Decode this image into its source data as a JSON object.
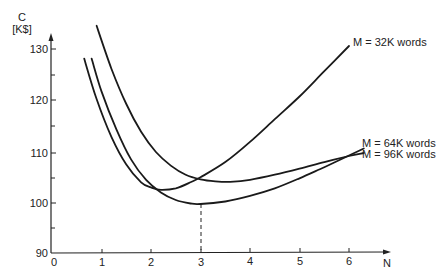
{
  "chart_data": {
    "type": "line",
    "title": "",
    "xlabel": "N",
    "ylabel": "C [K$]",
    "ylabel_lines": [
      "C",
      "[K$]"
    ],
    "xlim": [
      0,
      6.6
    ],
    "ylim": [
      90,
      133
    ],
    "x_ticks": [
      0,
      1,
      2,
      3,
      4,
      5,
      6
    ],
    "x_tick_labels": [
      "0",
      "1",
      "2",
      "3",
      "4",
      "5",
      "6"
    ],
    "y_ticks_major": [
      90,
      100,
      110,
      120,
      130
    ],
    "y_tick_labels": [
      "90",
      "100",
      "110",
      "120",
      "130"
    ],
    "y_ticks_minor": [
      95,
      105,
      115,
      125
    ],
    "grid": false,
    "legend": "inline labels at right end of curves",
    "series": [
      {
        "name": "M = 32K words",
        "x": [
          0.65,
          0.9,
          1.2,
          1.5,
          1.8,
          2.0,
          2.2,
          2.5,
          2.8,
          3.0,
          3.5,
          4.0,
          4.5,
          5.0,
          5.5,
          6.0
        ],
        "y": [
          128.5,
          120.5,
          113.0,
          107.5,
          104.0,
          103.0,
          102.5,
          102.8,
          104.0,
          105.0,
          108.0,
          112.0,
          116.5,
          121.0,
          126.0,
          131.0
        ]
      },
      {
        "name": "M = 64K words",
        "x": [
          0.8,
          1.0,
          1.3,
          1.6,
          1.9,
          2.2,
          2.5,
          2.8,
          3.0,
          3.5,
          4.0,
          4.5,
          5.0,
          5.5,
          6.0,
          6.3
        ],
        "y": [
          128.5,
          122.0,
          114.5,
          108.5,
          104.5,
          102.0,
          100.5,
          99.8,
          99.7,
          100.2,
          101.3,
          102.8,
          104.8,
          107.0,
          109.3,
          110.7
        ]
      },
      {
        "name": "M = 96K words",
        "x": [
          0.9,
          1.2,
          1.5,
          1.8,
          2.1,
          2.4,
          2.7,
          3.0,
          3.3,
          3.6,
          4.0,
          4.5,
          5.0,
          5.5,
          6.0,
          6.3
        ],
        "y": [
          135.0,
          126.5,
          119.5,
          114.0,
          110.0,
          107.3,
          105.5,
          104.6,
          104.2,
          104.1,
          104.5,
          105.5,
          106.7,
          108.0,
          109.2,
          109.8
        ]
      }
    ],
    "annotations": [
      {
        "type": "dashed-vertical",
        "x": 3,
        "from_y": 90,
        "to_y": 99.7,
        "description": "optimum N = 3 for M = 64K words"
      }
    ]
  },
  "labels": {
    "y_axis_title_line1": "C",
    "y_axis_title_line2": "[K$]",
    "x_axis_title": "N",
    "series_32k": "M = 32K words",
    "series_64k": "M = 64K words",
    "series_96k": "M = 96K words",
    "x_tick_0": "0",
    "x_tick_1": "1",
    "x_tick_2": "2",
    "x_tick_3": "3",
    "x_tick_4": "4",
    "x_tick_5": "5",
    "x_tick_6": "6",
    "y_tick_90": "90",
    "y_tick_100": "100",
    "y_tick_110": "110",
    "y_tick_120": "120",
    "y_tick_130": "130"
  }
}
